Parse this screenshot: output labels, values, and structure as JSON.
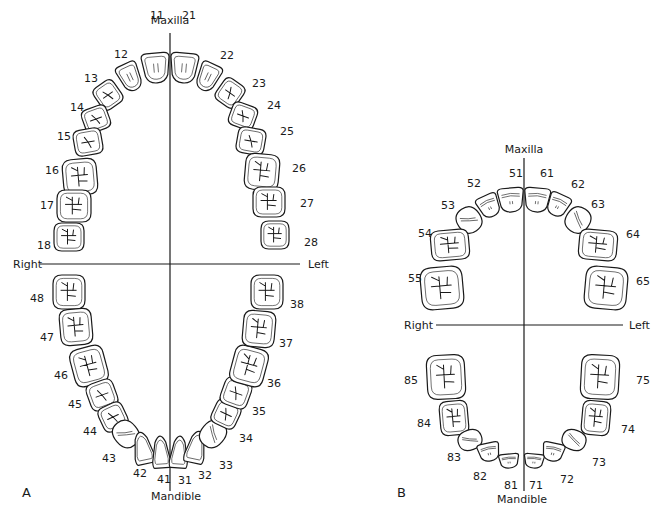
{
  "diagrams": [
    {
      "id": "A",
      "panel_label": "A",
      "panel_label_pos": [
        22,
        497
      ],
      "midline_x": 170,
      "midline_y": [
        33,
        491
      ],
      "horizontal_y": 264,
      "horizontal_x": [
        40,
        300
      ],
      "titles": {
        "top": {
          "text": "Maxilla",
          "x": 170,
          "y": 24
        },
        "bottom": {
          "text": "Mandible",
          "x": 176,
          "y": 500
        },
        "right": {
          "text": "Right",
          "x": 13,
          "y": 268
        },
        "left": {
          "text": "Left",
          "x": 308,
          "y": 268
        }
      },
      "teeth": [
        {
          "n": "11",
          "cx": 156,
          "cy": 68,
          "w": 28,
          "h": 30,
          "rot": -5,
          "type": "incisor",
          "lx": 150,
          "ly": 16
        },
        {
          "n": "12",
          "cx": 130,
          "cy": 77,
          "w": 22,
          "h": 28,
          "rot": -25,
          "type": "incisor",
          "lx": 114,
          "ly": 55
        },
        {
          "n": "13",
          "cx": 108,
          "cy": 95,
          "w": 24,
          "h": 26,
          "rot": -35,
          "type": "premolar",
          "lx": 84,
          "ly": 79
        },
        {
          "n": "14",
          "cx": 96,
          "cy": 119,
          "w": 26,
          "h": 24,
          "rot": -20,
          "type": "premolar",
          "lx": 70,
          "ly": 108
        },
        {
          "n": "15",
          "cx": 88,
          "cy": 142,
          "w": 28,
          "h": 26,
          "rot": -10,
          "type": "premolar",
          "lx": 57,
          "ly": 137
        },
        {
          "n": "16",
          "cx": 80,
          "cy": 177,
          "w": 34,
          "h": 36,
          "rot": -5,
          "type": "molar",
          "lx": 45,
          "ly": 171
        },
        {
          "n": "17",
          "cx": 74,
          "cy": 206,
          "w": 34,
          "h": 32,
          "rot": 0,
          "type": "molar",
          "lx": 40,
          "ly": 206
        },
        {
          "n": "18",
          "cx": 69,
          "cy": 237,
          "w": 30,
          "h": 28,
          "rot": 0,
          "type": "molar",
          "lx": 37,
          "ly": 246
        },
        {
          "n": "21",
          "cx": 184,
          "cy": 68,
          "w": 28,
          "h": 30,
          "rot": 5,
          "type": "incisor",
          "lx": 182,
          "ly": 16
        },
        {
          "n": "22",
          "cx": 208,
          "cy": 77,
          "w": 22,
          "h": 28,
          "rot": 25,
          "type": "incisor",
          "lx": 220,
          "ly": 56
        },
        {
          "n": "23",
          "cx": 230,
          "cy": 93,
          "w": 24,
          "h": 26,
          "rot": 35,
          "type": "premolar",
          "lx": 252,
          "ly": 84
        },
        {
          "n": "24",
          "cx": 243,
          "cy": 116,
          "w": 26,
          "h": 24,
          "rot": 20,
          "type": "premolar",
          "lx": 267,
          "ly": 106
        },
        {
          "n": "25",
          "cx": 251,
          "cy": 141,
          "w": 28,
          "h": 26,
          "rot": 10,
          "type": "premolar",
          "lx": 280,
          "ly": 132
        },
        {
          "n": "26",
          "cx": 262,
          "cy": 172,
          "w": 34,
          "h": 36,
          "rot": 5,
          "type": "molar",
          "lx": 292,
          "ly": 169
        },
        {
          "n": "27",
          "cx": 269,
          "cy": 202,
          "w": 32,
          "h": 30,
          "rot": 0,
          "type": "molar",
          "lx": 300,
          "ly": 204
        },
        {
          "n": "28",
          "cx": 275,
          "cy": 235,
          "w": 28,
          "h": 28,
          "rot": 0,
          "type": "molar",
          "lx": 304,
          "ly": 243
        },
        {
          "n": "48",
          "cx": 69,
          "cy": 292,
          "w": 32,
          "h": 34,
          "rot": 0,
          "type": "molar",
          "lx": 30,
          "ly": 299
        },
        {
          "n": "47",
          "cx": 76,
          "cy": 327,
          "w": 32,
          "h": 36,
          "rot": -5,
          "type": "molar",
          "lx": 40,
          "ly": 338
        },
        {
          "n": "46",
          "cx": 89,
          "cy": 366,
          "w": 34,
          "h": 38,
          "rot": -15,
          "type": "molar",
          "lx": 54,
          "ly": 376
        },
        {
          "n": "45",
          "cx": 102,
          "cy": 395,
          "w": 28,
          "h": 28,
          "rot": -20,
          "type": "premolar",
          "lx": 68,
          "ly": 405
        },
        {
          "n": "44",
          "cx": 113,
          "cy": 417,
          "w": 26,
          "h": 26,
          "rot": -25,
          "type": "premolar",
          "lx": 83,
          "ly": 432
        },
        {
          "n": "43",
          "cx": 126,
          "cy": 434,
          "w": 24,
          "h": 28,
          "rot": -40,
          "type": "canine",
          "lx": 102,
          "ly": 459
        },
        {
          "n": "42",
          "cx": 143,
          "cy": 448,
          "w": 20,
          "h": 32,
          "rot": -12,
          "type": "incisor-lower",
          "lx": 133,
          "ly": 474
        },
        {
          "n": "41",
          "cx": 161,
          "cy": 452,
          "w": 18,
          "h": 32,
          "rot": -4,
          "type": "incisor-lower",
          "lx": 157,
          "ly": 480
        },
        {
          "n": "31",
          "cx": 179,
          "cy": 452,
          "w": 18,
          "h": 32,
          "rot": 4,
          "type": "incisor-lower",
          "lx": 178,
          "ly": 481
        },
        {
          "n": "32",
          "cx": 196,
          "cy": 447,
          "w": 20,
          "h": 32,
          "rot": 12,
          "type": "incisor-lower",
          "lx": 198,
          "ly": 476
        },
        {
          "n": "33",
          "cx": 213,
          "cy": 434,
          "w": 24,
          "h": 28,
          "rot": 40,
          "type": "canine",
          "lx": 219,
          "ly": 466
        },
        {
          "n": "34",
          "cx": 226,
          "cy": 414,
          "w": 26,
          "h": 26,
          "rot": 25,
          "type": "premolar",
          "lx": 239,
          "ly": 439
        },
        {
          "n": "35",
          "cx": 236,
          "cy": 393,
          "w": 28,
          "h": 28,
          "rot": 20,
          "type": "premolar",
          "lx": 252,
          "ly": 412
        },
        {
          "n": "36",
          "cx": 249,
          "cy": 366,
          "w": 34,
          "h": 38,
          "rot": 15,
          "type": "molar",
          "lx": 267,
          "ly": 384
        },
        {
          "n": "37",
          "cx": 259,
          "cy": 329,
          "w": 32,
          "h": 36,
          "rot": 5,
          "type": "molar",
          "lx": 279,
          "ly": 344
        },
        {
          "n": "38",
          "cx": 267,
          "cy": 292,
          "w": 32,
          "h": 34,
          "rot": 0,
          "type": "molar",
          "lx": 290,
          "ly": 305
        }
      ]
    },
    {
      "id": "B",
      "panel_label": "B",
      "panel_label_pos": [
        397,
        497
      ],
      "midline_x": 524,
      "midline_y": [
        158,
        491
      ],
      "horizontal_y": 325,
      "horizontal_x": [
        436,
        623
      ],
      "titles": {
        "top": {
          "text": "Maxilla",
          "x": 524,
          "y": 153
        },
        "bottom": {
          "text": "Mandible",
          "x": 522,
          "y": 503
        },
        "right": {
          "text": "Right",
          "x": 404,
          "y": 329
        },
        "left": {
          "text": "Left",
          "x": 629,
          "y": 329
        }
      },
      "teeth": [
        {
          "n": "51",
          "cx": 511,
          "cy": 200,
          "w": 26,
          "h": 24,
          "rot": -5,
          "type": "primary-incisor",
          "lx": 509,
          "ly": 174
        },
        {
          "n": "52",
          "cx": 489,
          "cy": 206,
          "w": 22,
          "h": 22,
          "rot": -25,
          "type": "primary-incisor",
          "lx": 467,
          "ly": 184
        },
        {
          "n": "53",
          "cx": 469,
          "cy": 220,
          "w": 24,
          "h": 26,
          "rot": -35,
          "type": "primary-canine",
          "lx": 441,
          "ly": 206
        },
        {
          "n": "54",
          "cx": 450,
          "cy": 245,
          "w": 38,
          "h": 30,
          "rot": -5,
          "type": "molar",
          "lx": 418,
          "ly": 234
        },
        {
          "n": "55",
          "cx": 442,
          "cy": 288,
          "w": 42,
          "h": 42,
          "rot": -5,
          "type": "molar",
          "lx": 408,
          "ly": 279
        },
        {
          "n": "61",
          "cx": 537,
          "cy": 200,
          "w": 26,
          "h": 24,
          "rot": 5,
          "type": "primary-incisor",
          "lx": 540,
          "ly": 174
        },
        {
          "n": "62",
          "cx": 558,
          "cy": 205,
          "w": 22,
          "h": 22,
          "rot": 25,
          "type": "primary-incisor",
          "lx": 571,
          "ly": 185
        },
        {
          "n": "63",
          "cx": 578,
          "cy": 220,
          "w": 24,
          "h": 26,
          "rot": 35,
          "type": "primary-canine",
          "lx": 591,
          "ly": 205
        },
        {
          "n": "64",
          "cx": 598,
          "cy": 245,
          "w": 38,
          "h": 30,
          "rot": 5,
          "type": "molar",
          "lx": 626,
          "ly": 235
        },
        {
          "n": "65",
          "cx": 606,
          "cy": 288,
          "w": 42,
          "h": 42,
          "rot": 5,
          "type": "molar",
          "lx": 636,
          "ly": 282
        },
        {
          "n": "85",
          "cx": 446,
          "cy": 377,
          "w": 38,
          "h": 44,
          "rot": -3,
          "type": "molar",
          "lx": 404,
          "ly": 381
        },
        {
          "n": "84",
          "cx": 454,
          "cy": 418,
          "w": 28,
          "h": 34,
          "rot": -5,
          "type": "molar",
          "lx": 417,
          "ly": 424
        },
        {
          "n": "83",
          "cx": 470,
          "cy": 440,
          "w": 24,
          "h": 20,
          "rot": -20,
          "type": "primary-canine",
          "lx": 447,
          "ly": 458
        },
        {
          "n": "82",
          "cx": 489,
          "cy": 452,
          "w": 22,
          "h": 18,
          "rot": -12,
          "type": "primary-incisor",
          "lx": 473,
          "ly": 477
        },
        {
          "n": "81",
          "cx": 509,
          "cy": 461,
          "w": 20,
          "h": 14,
          "rot": -5,
          "type": "primary-incisor",
          "lx": 504,
          "ly": 486
        },
        {
          "n": "71",
          "cx": 534,
          "cy": 461,
          "w": 20,
          "h": 14,
          "rot": 5,
          "type": "primary-incisor",
          "lx": 529,
          "ly": 486
        },
        {
          "n": "72",
          "cx": 553,
          "cy": 452,
          "w": 22,
          "h": 18,
          "rot": 12,
          "type": "primary-incisor",
          "lx": 560,
          "ly": 480
        },
        {
          "n": "73",
          "cx": 574,
          "cy": 440,
          "w": 24,
          "h": 20,
          "rot": 20,
          "type": "primary-canine",
          "lx": 592,
          "ly": 463
        },
        {
          "n": "74",
          "cx": 596,
          "cy": 418,
          "w": 28,
          "h": 34,
          "rot": 5,
          "type": "molar",
          "lx": 621,
          "ly": 430
        },
        {
          "n": "75",
          "cx": 600,
          "cy": 377,
          "w": 38,
          "h": 44,
          "rot": 3,
          "type": "molar",
          "lx": 636,
          "ly": 381
        }
      ]
    }
  ]
}
